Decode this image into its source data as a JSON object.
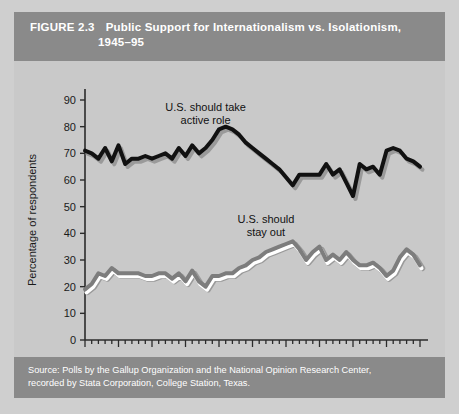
{
  "figure": {
    "number": "FIGURE 2.3",
    "title_line1": "Public Support for Internationalism vs. Isolationism,",
    "title_line2": "1945–95",
    "header_bg": "#8a8a8a",
    "panel_bg": "#c9c9c9",
    "page_bg": "#cfcfcf",
    "title_color": "#ffffff"
  },
  "source": {
    "line1": "Source: Polls by the Gallup Organization and the National Opinion Research Center,",
    "line2": "recorded by Stata Corporation, College Station, Texas."
  },
  "chart_data": {
    "type": "line",
    "title": "Public Support for Internationalism vs. Isolationism, 1945–95",
    "xlabel": "",
    "ylabel": "Percentage of respondents",
    "xlim": [
      1944,
      1996
    ],
    "ylim": [
      0,
      95
    ],
    "yticks": [
      0,
      10,
      20,
      30,
      40,
      50,
      60,
      70,
      80,
      90
    ],
    "ytick_labels": [
      "0",
      "10",
      "20",
      "30",
      "40",
      "50",
      "60",
      "70",
      "80",
      "90"
    ],
    "xticks": [
      1945,
      1950,
      1955,
      1960,
      1965,
      1970,
      1975,
      1980,
      1985,
      1990,
      1995
    ],
    "xtick_labels": [
      "1945",
      "1950",
      "1955",
      "1960",
      "1965",
      "1970",
      "1975",
      "1980",
      "1985",
      "1990",
      "1995"
    ],
    "minor_xtick_step": 1,
    "grid": false,
    "legend": "annotations",
    "annotations": [
      {
        "id": "active-role",
        "text_line1": "U.S. should take",
        "text_line2": "active role",
        "x": 1963,
        "y": 86
      },
      {
        "id": "stay-out",
        "text_line1": "U.S. should",
        "text_line2": "stay out",
        "x": 1972,
        "y": 44
      }
    ],
    "series": [
      {
        "name": "U.S. should take active role",
        "color": "#111111",
        "shadow_color": "#9a9a9a",
        "width": 4,
        "x": [
          1945,
          1946,
          1947,
          1948,
          1949,
          1950,
          1951,
          1952,
          1953,
          1954,
          1955,
          1956,
          1957,
          1958,
          1959,
          1960,
          1961,
          1962,
          1963,
          1964,
          1965,
          1966,
          1967,
          1968,
          1969,
          1970,
          1971,
          1972,
          1973,
          1974,
          1975,
          1976,
          1977,
          1978,
          1979,
          1980,
          1981,
          1982,
          1983,
          1984,
          1985,
          1986,
          1987,
          1988,
          1989,
          1990,
          1991,
          1992,
          1993,
          1994,
          1995
        ],
        "values": [
          71,
          70,
          68,
          72,
          67,
          73,
          66,
          68,
          68,
          69,
          68,
          69,
          70,
          68,
          72,
          69,
          73,
          70,
          72,
          75,
          79,
          80,
          79,
          77,
          74,
          72,
          70,
          68,
          66,
          64,
          61,
          58,
          62,
          62,
          62,
          62,
          66,
          62,
          64,
          59,
          54,
          66,
          64,
          65,
          62,
          71,
          72,
          71,
          68,
          67,
          65
        ]
      },
      {
        "name": "U.S. should stay out",
        "color": "#7d7d7d",
        "highlight_color": "#ffffff",
        "shadow_color": "#9a9a9a",
        "width": 4,
        "x": [
          1945,
          1946,
          1947,
          1948,
          1949,
          1950,
          1951,
          1952,
          1953,
          1954,
          1955,
          1956,
          1957,
          1958,
          1959,
          1960,
          1961,
          1962,
          1963,
          1964,
          1965,
          1966,
          1967,
          1968,
          1969,
          1970,
          1971,
          1972,
          1973,
          1974,
          1975,
          1976,
          1977,
          1978,
          1979,
          1980,
          1981,
          1982,
          1983,
          1984,
          1985,
          1986,
          1987,
          1988,
          1989,
          1990,
          1991,
          1992,
          1993,
          1994,
          1995
        ],
        "values": [
          19,
          21,
          25,
          24,
          27,
          25,
          25,
          25,
          25,
          24,
          24,
          25,
          25,
          23,
          25,
          22,
          26,
          22,
          20,
          24,
          24,
          25,
          25,
          27,
          28,
          30,
          31,
          33,
          34,
          35,
          36,
          37,
          34,
          30,
          33,
          35,
          30,
          32,
          30,
          33,
          30,
          28,
          28,
          29,
          27,
          24,
          26,
          31,
          34,
          32,
          28
        ]
      }
    ]
  }
}
